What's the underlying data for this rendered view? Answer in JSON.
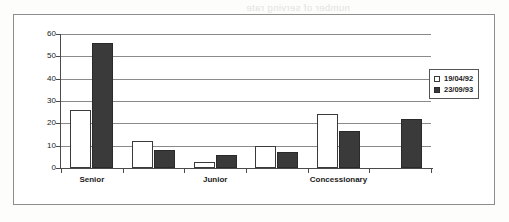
{
  "figure": {
    "ghost_text": "number of serving rate"
  },
  "chart_data": {
    "type": "bar",
    "title": "",
    "xlabel": "",
    "ylabel": "",
    "ylim": [
      0,
      60
    ],
    "yticks": [
      0,
      10,
      20,
      30,
      40,
      50,
      60
    ],
    "ytick_labels": [
      "0",
      "10",
      "20",
      "30",
      "40",
      "50",
      "60"
    ],
    "grid": true,
    "legend_position": "right",
    "categories": [
      "Senior",
      "",
      "Junior",
      "",
      "Concessionary",
      ""
    ],
    "category_labels_visible": [
      "Senior",
      "Junior",
      "Concessionary"
    ],
    "series": [
      {
        "name": "19/04/92",
        "color": "#ffffff",
        "edge_color": "#3a3a3a",
        "values": [
          26,
          12,
          2.5,
          10,
          24,
          0
        ]
      },
      {
        "name": "23/09/93",
        "color": "#3a3a3a",
        "edge_color": "#2a2a2a",
        "values": [
          56,
          8,
          6,
          7,
          16.5,
          22
        ]
      }
    ]
  },
  "legend": {
    "items": [
      {
        "label": "19/04/92",
        "swatch": "hollow-square-icon"
      },
      {
        "label": "23/09/93",
        "swatch": "filled-square-icon"
      }
    ]
  }
}
